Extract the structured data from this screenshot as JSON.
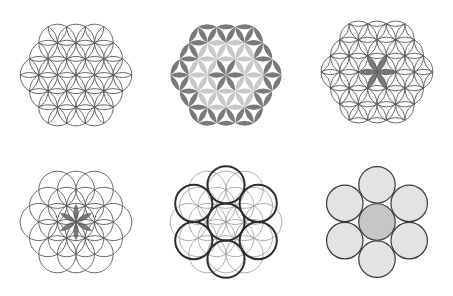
{
  "figures": [
    {
      "id": "flower-of-life-outline",
      "description": "19-circle Flower of Life, line drawing",
      "lattice_rings": 2,
      "style": "outline"
    },
    {
      "id": "flower-of-life-shaded",
      "description": "Flower of Life with filled petals: dark outer petals, light inner petals, dark center flower",
      "lattice_rings": 2,
      "style": "shaded"
    },
    {
      "id": "extended-petal-pattern",
      "description": "Petal lattice with pointed outer petals and dark central six-petal flower",
      "lattice_rings": 2,
      "style": "petals"
    },
    {
      "id": "flower-of-life-center-highlight",
      "description": "19 circles with shaded central six-petal flower",
      "lattice_rings": 2,
      "style": "center-highlight"
    },
    {
      "id": "seed-overlay",
      "description": "19 faint circles with 7 bold circles (spacing 2r) overlaid",
      "lattice_rings": 2,
      "style": "bold-seven"
    },
    {
      "id": "seven-circle-packing",
      "description": "Seven tangent filled circles, darker center",
      "style": "packing"
    }
  ],
  "colors": {
    "background": "#ffffff",
    "line": "#5a5a5a",
    "bold_line": "#2e2e2e",
    "dark_fill": "#7a7a7a",
    "light_fill": "#c8c8c8",
    "circle_fill": "#e3e3e3",
    "center_fill": "#c6c6c6"
  }
}
